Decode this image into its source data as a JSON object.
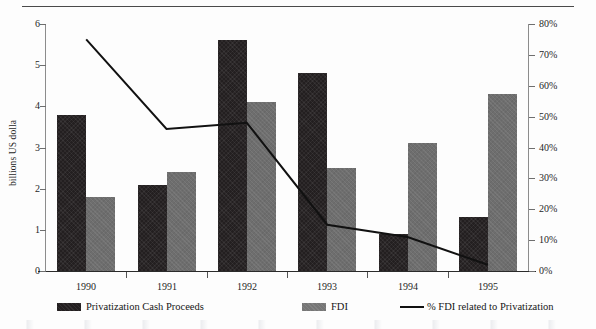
{
  "chart_data": {
    "type": "bar",
    "title": "",
    "xlabel": "",
    "ylabel": "billions US dolla",
    "categories": [
      "1990",
      "1991",
      "1992",
      "1993",
      "1994",
      "1995"
    ],
    "series": [
      {
        "name": "Privatization Cash Proceeds",
        "type": "bar",
        "axis": "left",
        "color": "#231f20",
        "values": [
          3.8,
          2.1,
          5.6,
          4.8,
          0.9,
          1.3
        ]
      },
      {
        "name": "FDI",
        "type": "bar",
        "axis": "left",
        "color": "#6e6e6e",
        "values": [
          1.8,
          2.4,
          4.1,
          2.5,
          3.1,
          4.3
        ]
      },
      {
        "name": "% FDI related to Privatization",
        "type": "line",
        "axis": "right",
        "color": "#111111",
        "values": [
          75,
          46,
          48,
          15,
          11,
          2
        ]
      }
    ],
    "left_axis": {
      "label": "billions US dolla",
      "min": 0,
      "max": 6,
      "step": 1,
      "ticks": [
        "0",
        "1",
        "2",
        "3",
        "4",
        "5",
        "6"
      ]
    },
    "right_axis": {
      "label": "",
      "min": 0,
      "max": 80,
      "step": 10,
      "ticks": [
        "0%",
        "10%",
        "20%",
        "30%",
        "40%",
        "50%",
        "60%",
        "70%",
        "80%"
      ]
    },
    "grid": false,
    "legend_position": "bottom"
  },
  "legend": {
    "items": [
      {
        "label": "Privatization Cash Proceeds",
        "marker": "swatch-dark"
      },
      {
        "label": "FDI",
        "marker": "swatch-light"
      },
      {
        "label": "% FDI related to Privatization",
        "marker": "line-black"
      }
    ]
  }
}
